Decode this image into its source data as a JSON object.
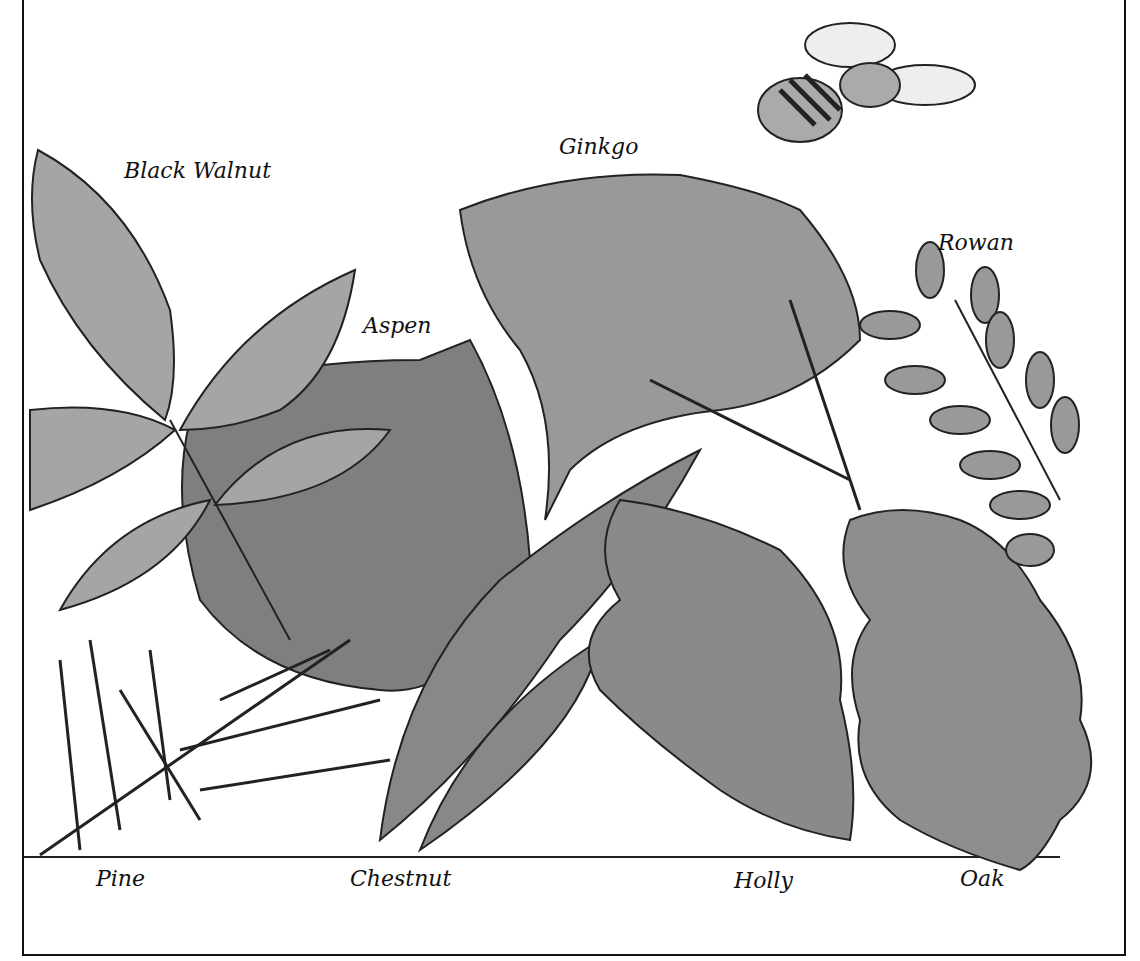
{
  "labels": {
    "black_walnut": "Black Walnut",
    "ginkgo": "Ginkgo",
    "rowan": "Rowan",
    "aspen": "Aspen",
    "pine": "Pine",
    "chestnut": "Chestnut",
    "holly": "Holly",
    "oak": "Oak"
  },
  "colors": {
    "leaf_fill": "#9a9a9a",
    "leaf_dark": "#7d7d7d",
    "outline": "#222222",
    "background": "#ffffff"
  }
}
